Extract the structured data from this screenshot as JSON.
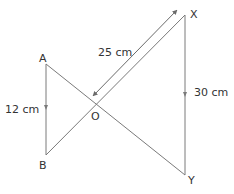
{
  "diagram": {
    "type": "similar-triangles",
    "colors": {
      "line": "#7a7a7a",
      "arrow": "#6a6a6a",
      "text": "#333333"
    },
    "points": {
      "A": {
        "label": "A",
        "x": 46,
        "y": 64
      },
      "B": {
        "label": "B",
        "x": 46,
        "y": 155
      },
      "X": {
        "label": "X",
        "x": 185,
        "y": 15
      },
      "Y": {
        "label": "Y",
        "x": 185,
        "y": 175
      },
      "O": {
        "label": "O",
        "x": 92,
        "y": 103
      }
    },
    "segments": [
      {
        "from": "A",
        "to": "B"
      },
      {
        "from": "A",
        "to": "Y"
      },
      {
        "from": "B",
        "to": "X"
      },
      {
        "from": "X",
        "to": "Y"
      }
    ],
    "measurements": {
      "AB": "12 cm",
      "XY": "30 cm",
      "OX": "25 cm"
    }
  }
}
